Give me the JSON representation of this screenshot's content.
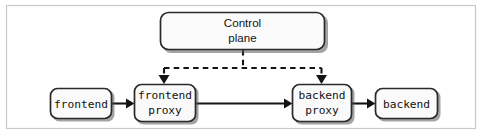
{
  "figure": {
    "width": 482,
    "height": 136,
    "background_color": "#ffffff",
    "frame_border_color": "#c8c8c8",
    "node_fill_color": "#fafafa",
    "node_border_color": "#2a2a2a",
    "line_color": "#141414"
  },
  "nodes": {
    "control_plane": {
      "label_line1": "Control",
      "label_line2": "plane",
      "font_style": "sans-serif",
      "x": 160,
      "y": 12,
      "width": 165,
      "height": 38
    },
    "frontend": {
      "label_line1": "frontend",
      "label_line2": "",
      "font_style": "monospace",
      "x": 50,
      "y": 88,
      "width": 62,
      "height": 31
    },
    "frontend_proxy": {
      "label_line1": "frontend",
      "label_line2": "proxy",
      "font_style": "monospace",
      "x": 134,
      "y": 84,
      "width": 62,
      "height": 38
    },
    "backend_proxy": {
      "label_line1": "backend",
      "label_line2": "proxy",
      "font_style": "monospace",
      "x": 292,
      "y": 84,
      "width": 60,
      "height": 38
    },
    "backend": {
      "label_line1": "backend",
      "label_line2": "",
      "font_style": "monospace",
      "x": 375,
      "y": 88,
      "width": 64,
      "height": 31
    }
  },
  "edges": {
    "frontend_to_frontend_proxy": {
      "style": "solid",
      "direction": "right"
    },
    "frontend_proxy_to_backend_proxy": {
      "style": "solid",
      "direction": "right"
    },
    "backend_proxy_to_backend": {
      "style": "solid",
      "direction": "right"
    },
    "control_plane_to_frontend_proxy": {
      "style": "dashed",
      "direction": "down"
    },
    "control_plane_to_backend_proxy": {
      "style": "dashed",
      "direction": "down"
    }
  }
}
